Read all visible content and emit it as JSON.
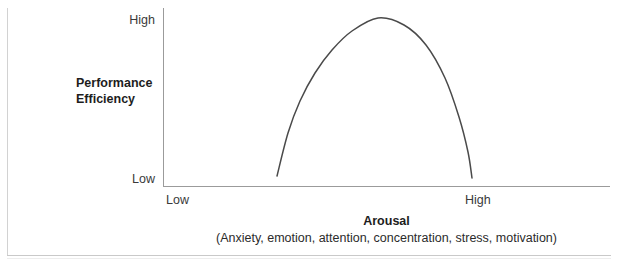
{
  "chart_data": {
    "type": "line",
    "title": "",
    "xlabel": "Arousal",
    "xlabel_note": "(Anxiety, emotion, attention, concentration, stress, motivation)",
    "ylabel_line1": "Performance",
    "ylabel_line2": "Efficiency",
    "x_ticks": [
      "Low",
      "High"
    ],
    "y_ticks": [
      "High",
      "Low"
    ],
    "xlim": [
      "Low",
      "High"
    ],
    "ylim": [
      "Low",
      "High"
    ],
    "grid": false,
    "legend": null,
    "curve_name": "inverted-u-performance-curve",
    "curve_color": "#4a4a4a",
    "series": [
      {
        "name": "Performance Efficiency vs Arousal",
        "points": [
          {
            "x": 277,
            "y": 176
          },
          {
            "x": 288,
            "y": 133
          },
          {
            "x": 300,
            "y": 101
          },
          {
            "x": 315,
            "y": 73
          },
          {
            "x": 332,
            "y": 50
          },
          {
            "x": 352,
            "y": 31
          },
          {
            "x": 378,
            "y": 18
          },
          {
            "x": 404,
            "y": 25
          },
          {
            "x": 426,
            "y": 45
          },
          {
            "x": 445,
            "y": 78
          },
          {
            "x": 459,
            "y": 117
          },
          {
            "x": 468,
            "y": 152
          },
          {
            "x": 472,
            "y": 178
          }
        ]
      }
    ]
  },
  "axes": {
    "y_high": "High",
    "y_low": "Low",
    "x_low": "Low",
    "x_high": "High",
    "y_title_line1": "Performance",
    "y_title_line2": "Efficiency",
    "x_title": "Arousal",
    "x_subtitle": "(Anxiety, emotion, attention, concentration, stress, motivation)"
  },
  "colors": {
    "curve": "#4a4a4a",
    "axis": "#9b9b9b",
    "frame": "#d2d2d2",
    "text": "#1d1d1d",
    "background": "#ffffff"
  }
}
